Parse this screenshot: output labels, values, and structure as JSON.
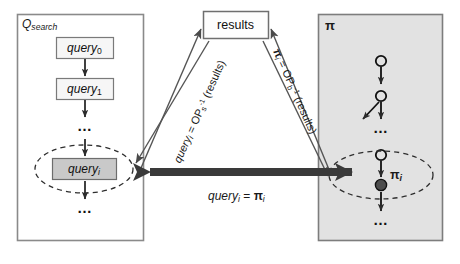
{
  "diagram": {
    "colors": {
      "panel_border": "#808080",
      "left_panel_fill": "#ffffff",
      "right_panel_fill": "#e0e0e0",
      "box_fill": "#f5f5f5",
      "highlight_box_fill": "#c8c8c8",
      "arrow_dark": "#3a3a3a",
      "line": "#4d4d4d",
      "text": "#111111"
    },
    "left_panel": {
      "name": "Q_search",
      "label_main": "Q",
      "label_sub": "search",
      "nodes": [
        {
          "label_main": "query",
          "label_sub": "0",
          "highlighted": false
        },
        {
          "label_main": "query",
          "label_sub": "1",
          "highlighted": false
        },
        {
          "label_main": "…",
          "label_sub": "",
          "highlighted": false
        },
        {
          "label_main": "query",
          "label_sub": "i",
          "highlighted": true
        },
        {
          "label_main": "…",
          "label_sub": "",
          "highlighted": false
        }
      ],
      "ellipse_label": "query-i-selection"
    },
    "right_panel": {
      "name": "π",
      "label_main": "π",
      "node_label_main": "π",
      "node_label_sub": "i",
      "dots_upper": "…",
      "dots_lower": "…",
      "ellipse_label": "pi-i-selection"
    },
    "results_box": {
      "label": "results"
    },
    "edges": {
      "left_diagonal": {
        "text_main": "query",
        "text_sub": "i",
        "text_eq": " = OP",
        "text_op_sub": "s",
        "text_op_sup": "-1",
        "text_tail": " (results)",
        "full": "query_i = OP_s^-1 (results)"
      },
      "right_diagonal": {
        "text_main": "π",
        "text_sub": "i",
        "text_eq": " = OP",
        "text_op_sub": "b",
        "text_op_sup": "-1",
        "text_tail": " (results)",
        "full": "π_i = OP_b^-1 (results)"
      },
      "center": {
        "text_left_main": "query",
        "text_left_sub": "i",
        "text_eq": " = ",
        "text_right_main": "π",
        "text_right_sub": "i",
        "full": "query_i = π_i"
      }
    }
  }
}
